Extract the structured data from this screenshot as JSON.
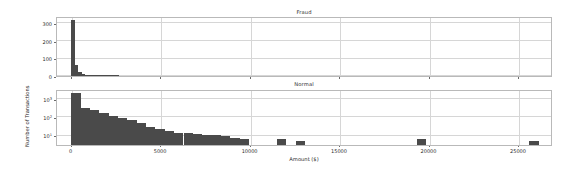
{
  "figure": {
    "background_color": "#ffffff",
    "bar_color": "#4a4a4a",
    "grid_color": "#d6d6d6",
    "axis_color": "#b9b9b9",
    "text_color": "#2b2b2b",
    "xlabel": "Amount ($)",
    "ylabel": "Number of Transactions"
  },
  "chart_data": [
    {
      "type": "bar",
      "title": "Fraud",
      "xlabel": "",
      "ylabel": "",
      "xlim": [
        -800,
        26800
      ],
      "ylim": [
        0,
        340
      ],
      "yticks": [
        0,
        100,
        200,
        300
      ],
      "ytick_labels": [
        "0",
        "100",
        "200",
        "300"
      ],
      "xticks": [
        0,
        5000,
        10000,
        15000,
        20000,
        25000
      ],
      "xtick_labels": [
        "",
        "",
        "",
        "",
        "",
        ""
      ],
      "yscale": "linear",
      "grid": true,
      "legend": "none",
      "bin_width": 190,
      "bin_starts": [
        0,
        190,
        380,
        570,
        760,
        950,
        1140,
        1330,
        1520,
        1710,
        1900,
        2090,
        2280,
        2470
      ],
      "values": [
        320,
        62,
        24,
        13,
        8,
        5,
        4,
        3,
        2,
        2,
        1,
        1,
        1,
        1
      ]
    },
    {
      "type": "bar",
      "title": "Normal",
      "xlabel": "Amount ($)",
      "ylabel": "Number of Transactions",
      "xlim": [
        -800,
        26800
      ],
      "ylim": [
        3,
        4000
      ],
      "yticks": [
        10,
        100,
        1000
      ],
      "ytick_labels": [
        "10¹",
        "10²",
        "10³"
      ],
      "xticks": [
        0,
        5000,
        10000,
        15000,
        20000,
        25000
      ],
      "xtick_labels": [
        "0",
        "5000",
        "10000",
        "15000",
        "20000",
        "25000"
      ],
      "yscale": "log",
      "grid": true,
      "legend": "none",
      "bin_width": 520,
      "bin_starts": [
        0,
        520,
        1040,
        1560,
        2080,
        2600,
        3120,
        3640,
        4160,
        4680,
        5200,
        5720,
        6240,
        6760,
        7280,
        7800,
        8320,
        8840,
        9360,
        11440,
        12480,
        19240,
        25480
      ],
      "values": [
        2300,
        330,
        250,
        175,
        120,
        95,
        70,
        48,
        30,
        22,
        17,
        14,
        13,
        11,
        10,
        10,
        9,
        7,
        6,
        6,
        5,
        6,
        5
      ]
    }
  ]
}
